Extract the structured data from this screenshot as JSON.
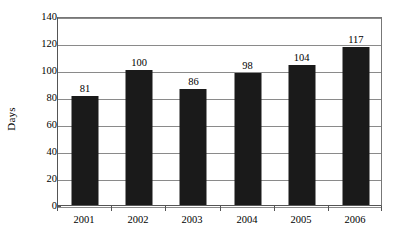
{
  "chart_data": {
    "type": "bar",
    "title": "",
    "xlabel": "",
    "ylabel": "Days",
    "categories": [
      "2001",
      "2002",
      "2003",
      "2004",
      "2005",
      "2006"
    ],
    "values": [
      81,
      100,
      86,
      98,
      104,
      117
    ],
    "data_labels": [
      "81",
      "100",
      "86",
      "98",
      "104",
      "117"
    ],
    "ylim": [
      0,
      140
    ],
    "ytick_values": [
      0,
      20,
      40,
      60,
      80,
      100,
      120,
      140
    ],
    "ytick_labels": [
      "0",
      "20",
      "40",
      "60",
      "80",
      "100",
      "120",
      "140"
    ],
    "grid": true,
    "grid_axis": "y",
    "legend": false,
    "legend_position": "none",
    "series": [
      {
        "name": "Days",
        "values": [
          81,
          100,
          86,
          98,
          104,
          117
        ]
      }
    ],
    "colors": {
      "bar_fill": "#1a1a1a",
      "gridline": "#8a8a8a",
      "axis": "#555555",
      "background": "#ffffff",
      "text": "#000000"
    }
  }
}
